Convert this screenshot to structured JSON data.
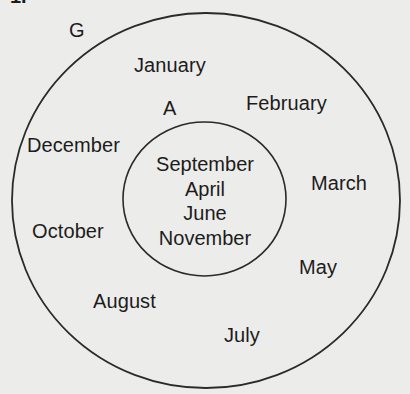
{
  "figure": {
    "number_label": "1.",
    "universal_set_label": "G",
    "subset_label": "A",
    "outside_subset_months": [
      "January",
      "February",
      "March",
      "May",
      "July",
      "August",
      "October",
      "December"
    ],
    "inside_subset_months": [
      "September",
      "April",
      "June",
      "November"
    ],
    "colors": {
      "background": "#ececea",
      "stroke": "#2a2a2a",
      "text": "#1c1c1c"
    }
  }
}
